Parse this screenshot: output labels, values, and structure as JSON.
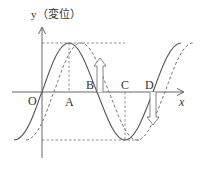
{
  "diagram": {
    "y_axis_label": "y（変位）",
    "x_axis_label": "x",
    "points": [
      {
        "id": "O",
        "label": "O"
      },
      {
        "id": "A",
        "label": "A"
      },
      {
        "id": "B",
        "label": "B"
      },
      {
        "id": "C",
        "label": "C"
      },
      {
        "id": "D",
        "label": "D"
      }
    ],
    "curves": [
      {
        "name": "current-wave",
        "style": "solid"
      },
      {
        "name": "shifted-wave",
        "style": "dashed"
      }
    ],
    "arrows": [
      {
        "at": "B",
        "direction": "up"
      },
      {
        "at": "D",
        "direction": "down"
      }
    ],
    "colors": {
      "line": "#555555",
      "dashed": "#777777",
      "text": "#333333"
    }
  }
}
